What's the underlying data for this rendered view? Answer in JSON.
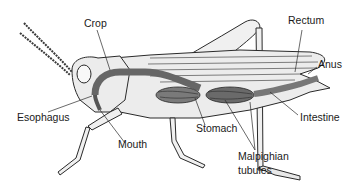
{
  "diagram": {
    "labels": {
      "crop": "Crop",
      "rectum": "Rectum",
      "anus": "Anus",
      "esophagus": "Esophagus",
      "mouth": "Mouth",
      "stomach": "Stomach",
      "intestine": "Intestine",
      "malpighian_line1": "Malpighian",
      "malpighian_line2": "tubules"
    },
    "colors": {
      "body_fill": "#ececec",
      "outline": "#2a2a2a",
      "gut_dark": "#555555",
      "gut_mid": "#8a8a8a",
      "label_text": "#1a1a1a"
    }
  }
}
